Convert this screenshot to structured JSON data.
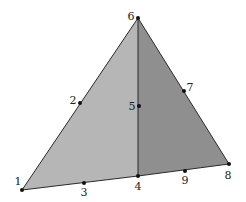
{
  "diagram": {
    "type": "triangular finite element mesh (two 6-node triangles)",
    "colors": {
      "background": "#ffffff",
      "left_face": "#b6b6b6",
      "right_face": "#8f8f8f",
      "edge": "#2a2a2a",
      "node": "#111111",
      "label": "#222222"
    },
    "faces": [
      {
        "name": "left-element",
        "nodes": [
          "1",
          "4",
          "6"
        ],
        "color": "#b6b6b6"
      },
      {
        "name": "right-element",
        "nodes": [
          "4",
          "8",
          "6"
        ],
        "color": "#8f8f8f"
      }
    ],
    "nodes": [
      {
        "id": "1",
        "label": "1",
        "x": 22,
        "y": 190,
        "lx": 18,
        "ly": 185
      },
      {
        "id": "2",
        "label": "2",
        "x": 80,
        "y": 103,
        "lx": 73,
        "ly": 104
      },
      {
        "id": "3",
        "label": "3",
        "x": 84,
        "y": 183,
        "lx": 84,
        "ly": 196
      },
      {
        "id": "4",
        "label": "4",
        "x": 138,
        "y": 176,
        "lx": 138,
        "ly": 190
      },
      {
        "id": "5",
        "label": "5",
        "x": 139,
        "y": 106,
        "lx": 132,
        "ly": 110
      },
      {
        "id": "6",
        "label": "6",
        "x": 138,
        "y": 18,
        "lx": 131,
        "ly": 20
      },
      {
        "id": "7",
        "label": "7",
        "x": 184,
        "y": 91,
        "lx": 190,
        "ly": 91
      },
      {
        "id": "8",
        "label": "8",
        "x": 229,
        "y": 164,
        "lx": 228,
        "ly": 179
      },
      {
        "id": "9",
        "label": "9",
        "x": 185,
        "y": 171,
        "lx": 185,
        "ly": 184
      }
    ],
    "edges": [
      [
        "1",
        "6"
      ],
      [
        "6",
        "8"
      ],
      [
        "1",
        "4"
      ],
      [
        "4",
        "8"
      ],
      [
        "4",
        "6"
      ]
    ]
  }
}
